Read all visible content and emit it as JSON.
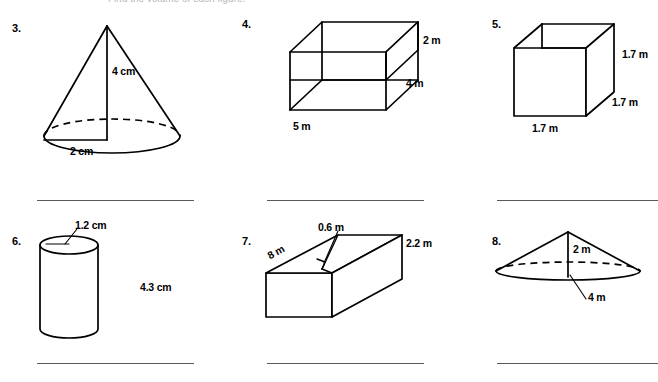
{
  "page": {
    "background_color": "#ffffff",
    "ink_color": "#000000",
    "answer_line_color": "#5a5a5a",
    "cropped_header_text": "Find the volume of each figure."
  },
  "problems": [
    {
      "number": "3.",
      "figure": "cone",
      "labels": [
        {
          "text": "4 cm",
          "meaning": "height"
        },
        {
          "text": "2 cm",
          "meaning": "radius"
        }
      ]
    },
    {
      "number": "4.",
      "figure": "rectangular-prism",
      "labels": [
        {
          "text": "2 m",
          "meaning": "height"
        },
        {
          "text": "4 m",
          "meaning": "depth"
        },
        {
          "text": "5 m",
          "meaning": "width"
        }
      ]
    },
    {
      "number": "5.",
      "figure": "cube",
      "labels": [
        {
          "text": "1.7 m",
          "meaning": "height"
        },
        {
          "text": "1.7 m",
          "meaning": "depth"
        },
        {
          "text": "1.7 m",
          "meaning": "width"
        }
      ]
    },
    {
      "number": "6.",
      "figure": "cylinder",
      "labels": [
        {
          "text": "1.2 cm",
          "meaning": "radius"
        },
        {
          "text": "4.3 cm",
          "meaning": "height"
        }
      ]
    },
    {
      "number": "7.",
      "figure": "rectangular-prism-long",
      "labels": [
        {
          "text": "0.6 m",
          "meaning": "width"
        },
        {
          "text": "2.2 m",
          "meaning": "height"
        },
        {
          "text": "8 m",
          "meaning": "length"
        }
      ]
    },
    {
      "number": "8.",
      "figure": "wide-cone",
      "labels": [
        {
          "text": "2 m",
          "meaning": "height"
        },
        {
          "text": "4 m",
          "meaning": "radius"
        }
      ]
    }
  ],
  "answer_lines": {
    "count": 6,
    "row_top_y": 200,
    "row_bottom_y": 363,
    "columns": [
      {
        "left": 37,
        "width": 157
      },
      {
        "left": 267,
        "width": 157
      },
      {
        "left": 497,
        "width": 161
      }
    ]
  }
}
